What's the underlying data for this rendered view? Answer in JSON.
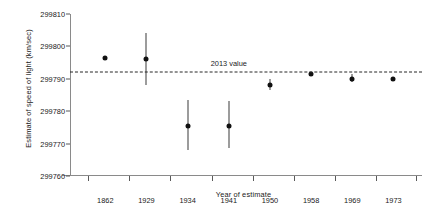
{
  "chart_data": {
    "type": "scatter",
    "title": "",
    "xlabel": "Year of estimate",
    "ylabel": "Estimate of speed of light (km/sec)",
    "categories": [
      "1862",
      "1929",
      "1934",
      "1941",
      "1950",
      "1958",
      "1969",
      "1973"
    ],
    "values": [
      299796.5,
      299796.0,
      299775.5,
      299775.5,
      299788.0,
      299791.5,
      299790.0,
      299790.0
    ],
    "error_low": [
      null,
      299788.0,
      299768.0,
      299768.5,
      299786.5,
      null,
      299789.0,
      null
    ],
    "error_high": [
      null,
      299804.0,
      299783.5,
      299783.0,
      299790.0,
      null,
      299791.5,
      null
    ],
    "has_error_bars": [
      false,
      true,
      true,
      true,
      true,
      false,
      true,
      false
    ],
    "ylim": [
      299760,
      299810
    ],
    "yticks": [
      299810,
      299800,
      299790,
      299780,
      299770,
      299760
    ],
    "ytick_labels": [
      "299810",
      "299800",
      "299790",
      "299780",
      "299770",
      "299760"
    ],
    "grid": false,
    "legend": "none",
    "annotations": [
      {
        "name": "reference-line-2013",
        "label": "2013 value",
        "y": 299792.0,
        "style": "dashed"
      }
    ],
    "colors": {
      "point": "#111111",
      "errorbar": "#3a3a3a",
      "refline": "#262626",
      "axis": "#8a8a8a",
      "text": "#1a1a1a",
      "background": "#ffffff"
    }
  }
}
